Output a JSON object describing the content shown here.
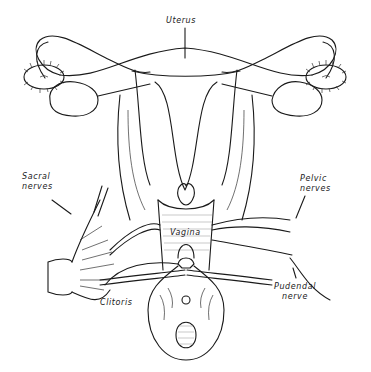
{
  "diagram": {
    "type": "anatomical line drawing",
    "labels": {
      "uterus": "Uterus",
      "sacral_nerves_1": "Sacral",
      "sacral_nerves_2": "nerves",
      "pelvic_nerves_1": "Pelvic",
      "pelvic_nerves_2": "nerves",
      "vagina": "Vagina",
      "clitoris": "Clitoris",
      "pudendal_nerve_1": "Pudendal",
      "pudendal_nerve_2": "nerve"
    },
    "colors": {
      "line": "#1a1a1a",
      "background": "#ffffff"
    }
  }
}
